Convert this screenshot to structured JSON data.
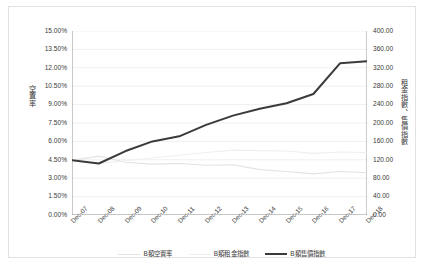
{
  "chart_data": {
    "type": "line",
    "title": "",
    "xlabel": "",
    "ylabel": "空置率",
    "ylabel_secondary": "租金指數、售價指數",
    "grid": true,
    "legend_position": "bottom",
    "categories": [
      "Dec-07",
      "Dec-08",
      "Dec-09",
      "Dec-10",
      "Dec-11",
      "Dec-12",
      "Dec-13",
      "Dec-14",
      "Dec-15",
      "Dec-16",
      "Dec-17",
      "Dec-18"
    ],
    "y_left": {
      "min": 0,
      "max": 15,
      "step": 1.5,
      "unit": "%",
      "ticks": [
        "0.00%",
        "1.50%",
        "3.00%",
        "4.50%",
        "6.00%",
        "7.50%",
        "9.00%",
        "10.50%",
        "12.00%",
        "13.50%",
        "15.00%"
      ]
    },
    "y_right": {
      "min": 0,
      "max": 400,
      "step": 40,
      "ticks": [
        "0.00",
        "40.00",
        "80.00",
        "120.00",
        "160.00",
        "200.00",
        "240.00",
        "280.00",
        "320.00",
        "360.00",
        "400.00"
      ]
    },
    "series": [
      {
        "name": "B類空置率",
        "axis": "left",
        "color": "#e3e3e3",
        "width": 1.1,
        "values": [
          4.45,
          4.8,
          4.3,
          4.15,
          4.2,
          4.05,
          4.1,
          3.7,
          3.55,
          3.35,
          3.55,
          3.45
        ]
      },
      {
        "name": "B類租金指數",
        "axis": "right",
        "color": "#efefef",
        "width": 1.1,
        "values": [
          118,
          112,
          118,
          124,
          130,
          136,
          141,
          140,
          139,
          134,
          137,
          136
        ]
      },
      {
        "name": "B類售價指數",
        "axis": "right",
        "color": "#3b3b3b",
        "width": 2.0,
        "values": [
          119,
          112,
          139,
          160,
          171,
          196,
          216,
          231,
          243,
          263,
          330,
          334
        ]
      }
    ]
  }
}
